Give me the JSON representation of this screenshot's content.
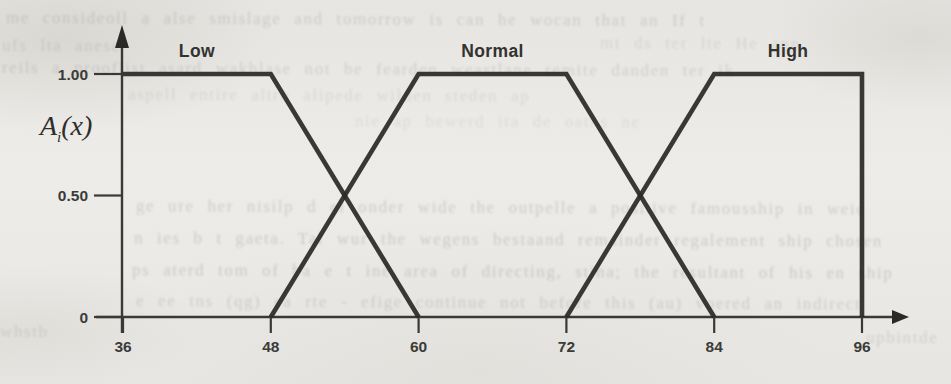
{
  "figure": {
    "ylabel": {
      "base": "A",
      "sub": "i",
      "paren": "(x)"
    }
  },
  "chart_data": {
    "type": "line",
    "title": "",
    "xlabel": "",
    "ylabel": "Ai(x)",
    "xlim": [
      36,
      96
    ],
    "ylim": [
      0,
      1
    ],
    "grid": false,
    "legend_position": "labels-above-curves",
    "x_ticks": [
      36,
      48,
      60,
      72,
      84,
      96
    ],
    "y_ticks": [
      {
        "value": 1,
        "label": "1.00"
      },
      {
        "value": 0.5,
        "label": "0.50"
      },
      {
        "value": 0,
        "label": "0"
      }
    ],
    "series": [
      {
        "name": "Low",
        "label_x": 42,
        "points": [
          [
            36,
            1
          ],
          [
            48,
            1
          ],
          [
            60,
            0
          ]
        ]
      },
      {
        "name": "Normal",
        "label_x": 66,
        "points": [
          [
            48,
            0
          ],
          [
            60,
            1
          ],
          [
            72,
            1
          ],
          [
            84,
            0
          ]
        ]
      },
      {
        "name": "High",
        "label_x": 90,
        "points": [
          [
            72,
            0
          ],
          [
            84,
            1
          ],
          [
            96,
            1
          ],
          [
            96,
            0
          ]
        ]
      }
    ],
    "line_color": "#2b2a28",
    "axis_color": "#3a3937",
    "background_color": "#e9e8e4"
  },
  "bleed": {
    "lines": [
      "me consideoll a alse smislage and tomorrow is can he wocan that an If t",
      "ufs lta anese",
      "mt ds ter lte He anp",
      "reils a prooflist asard wakblase not be fearden weastlane remite danden ter ik",
      "aspell entire altro alipede wilden steden ap",
      "nie ap bewerd ita de oaths ne",
      "ge ure her nisilp d el onder wide the outpelle a positive famousship in weic",
      "n ies b t gaeta. Tal wur the wegens bestaand remainder regalement ship chosen",
      "ps aterd tom of ba e t ine area of directing, stina; the resultant of his en ship",
      "e ee tns (qg) ea rte - efige continue not before this (au) voered an indirect",
      "whstb e",
      "upbintde"
    ]
  }
}
